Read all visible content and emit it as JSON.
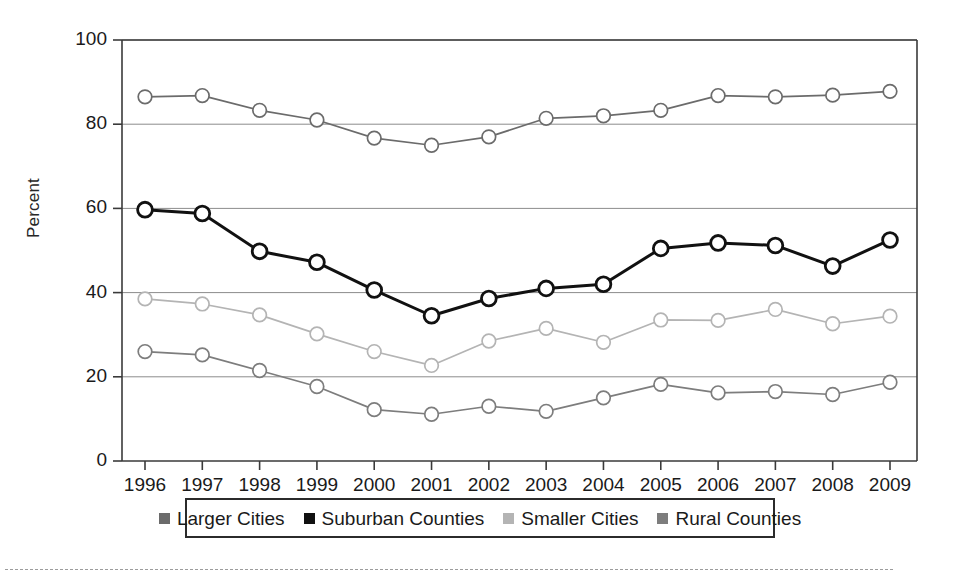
{
  "chart_data": {
    "type": "line",
    "title": "",
    "subtitle": "",
    "xlabel": "",
    "ylabel": "Percent",
    "ylim": [
      0,
      100
    ],
    "yticks": [
      0,
      20,
      40,
      60,
      80,
      100
    ],
    "grid": "horizontal",
    "legend_position": "bottom",
    "categories": [
      "1996",
      "1997",
      "1998",
      "1999",
      "2000",
      "2001",
      "2002",
      "2003",
      "2004",
      "2005",
      "2006",
      "2007",
      "2008",
      "2009"
    ],
    "series": [
      {
        "name": "Larger Cities",
        "color": "#6b6b6b",
        "marker": "open-circle",
        "values": [
          86.5,
          86.8,
          83.3,
          81.0,
          76.7,
          75.0,
          77.0,
          81.4,
          82.0,
          83.3,
          86.8,
          86.5,
          86.9,
          87.8
        ]
      },
      {
        "name": "Suburban Counties",
        "color": "#111111",
        "marker": "open-circle",
        "values": [
          59.7,
          58.8,
          49.8,
          47.2,
          40.6,
          34.5,
          38.6,
          41.0,
          42.0,
          50.5,
          51.8,
          51.2,
          46.3,
          52.5
        ]
      },
      {
        "name": "Smaller Cities",
        "color": "#b4b4b4",
        "marker": "open-circle",
        "values": [
          38.5,
          37.3,
          34.7,
          30.2,
          26.0,
          22.7,
          28.5,
          31.5,
          28.2,
          33.5,
          33.4,
          36.0,
          32.6,
          34.4
        ]
      },
      {
        "name": "Rural Counties",
        "color": "#7d7d7d",
        "marker": "open-circle",
        "values": [
          26.0,
          25.2,
          21.5,
          17.7,
          12.2,
          11.1,
          13.0,
          11.8,
          15.0,
          18.2,
          16.2,
          16.5,
          15.8,
          18.7
        ]
      }
    ]
  },
  "legend": {
    "entries": [
      {
        "label": "Larger Cities",
        "swatch_color": "#6b6b6b"
      },
      {
        "label": "Suburban Counties",
        "swatch_color": "#111111"
      },
      {
        "label": "Smaller Cities",
        "swatch_color": "#b4b4b4"
      },
      {
        "label": "Rural Counties",
        "swatch_color": "#7d7d7d"
      }
    ]
  }
}
